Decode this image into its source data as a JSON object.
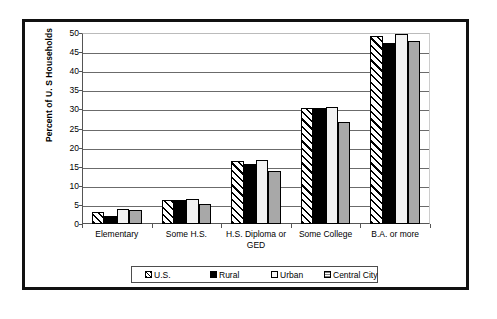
{
  "chart_data": {
    "type": "bar",
    "title": "",
    "xlabel": "",
    "ylabel": "Percent of U. S Households",
    "ylim": [
      0,
      50
    ],
    "ytick_step": 5,
    "yticks": [
      0,
      5,
      10,
      15,
      20,
      25,
      30,
      35,
      40,
      45,
      50
    ],
    "grid": "horizontal",
    "legend_position": "bottom",
    "categories": [
      "Elementary",
      "Some H.S.",
      "H.S. Diploma or GED",
      "Some College",
      "B.A. or more"
    ],
    "series": [
      {
        "name": "U.S.",
        "fill": "diagonal-hatch",
        "color": "#ffffff",
        "values": [
          3.1,
          6.4,
          16.5,
          30.5,
          49.2
        ]
      },
      {
        "name": "Rural",
        "fill": "solid-black",
        "color": "#000000",
        "values": [
          2.0,
          6.3,
          15.7,
          30.3,
          47.3
        ]
      },
      {
        "name": "Urban",
        "fill": "solid-light",
        "color": "#f2f2f2",
        "values": [
          3.9,
          6.5,
          16.8,
          30.7,
          49.7
        ]
      },
      {
        "name": "Central City",
        "fill": "solid-gray",
        "color": "#a8a8a8",
        "values": [
          3.7,
          5.3,
          14.0,
          26.8,
          47.9
        ]
      }
    ]
  },
  "axis": {
    "y_title": "Percent of U. S Households",
    "y_tick_labels": [
      "50",
      "45",
      "40",
      "35",
      "30",
      "25",
      "20",
      "15",
      "10",
      "5",
      "0"
    ],
    "x_tick_labels": [
      "Elementary",
      "Some H.S.",
      "H.S. Diploma or\nGED",
      "Some College",
      "B.A. or more"
    ]
  },
  "legend": {
    "items": [
      {
        "label": "U.S."
      },
      {
        "label": "Rural"
      },
      {
        "label": "Urban"
      },
      {
        "label": "Central City"
      }
    ]
  }
}
